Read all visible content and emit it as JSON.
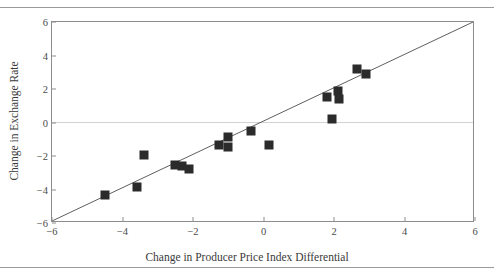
{
  "figure": {
    "title_clipped": "",
    "top_rule": "horizontal-rule",
    "bottom_rule": "horizontal-rule"
  },
  "chart_data": {
    "type": "scatter",
    "title": "",
    "xlabel": "Change in Producer Price Index Differential",
    "ylabel": "Change in Exchange Rate",
    "xlim": [
      -6,
      6
    ],
    "ylim": [
      -6,
      6
    ],
    "xticks": [
      -6,
      -4,
      -2,
      0,
      2,
      4,
      6
    ],
    "yticks": [
      -6,
      -4,
      -2,
      0,
      2,
      4,
      6
    ],
    "xticklabels": [
      "-6",
      "-4",
      "-2",
      "0",
      "2",
      "4",
      "6"
    ],
    "yticklabels": [
      "-6",
      "-4",
      "-2",
      "0",
      "2",
      "4",
      "6"
    ],
    "grid": false,
    "zero_gridline": true,
    "legend": null,
    "reference_line": {
      "name": "45-degree identity line",
      "from": [
        -6,
        -6
      ],
      "to": [
        6,
        6
      ],
      "color": "#4a4a4a"
    },
    "marker": {
      "shape": "square",
      "color": "#2b2b2b",
      "size_px": 9
    },
    "points": [
      {
        "x": -4.5,
        "y": -4.3
      },
      {
        "x": -3.6,
        "y": -3.85
      },
      {
        "x": -3.4,
        "y": -1.95
      },
      {
        "x": -2.5,
        "y": -2.55
      },
      {
        "x": -2.32,
        "y": -2.6
      },
      {
        "x": -2.1,
        "y": -2.75
      },
      {
        "x": -1.25,
        "y": -1.32
      },
      {
        "x": -1.02,
        "y": -0.85
      },
      {
        "x": -1.0,
        "y": -1.45
      },
      {
        "x": -0.35,
        "y": -0.5
      },
      {
        "x": 0.15,
        "y": -1.35
      },
      {
        "x": 1.8,
        "y": 1.55
      },
      {
        "x": 1.95,
        "y": 0.2
      },
      {
        "x": 2.1,
        "y": 1.9
      },
      {
        "x": 2.15,
        "y": 1.4
      },
      {
        "x": 2.65,
        "y": 3.2
      },
      {
        "x": 2.9,
        "y": 2.9
      }
    ]
  }
}
